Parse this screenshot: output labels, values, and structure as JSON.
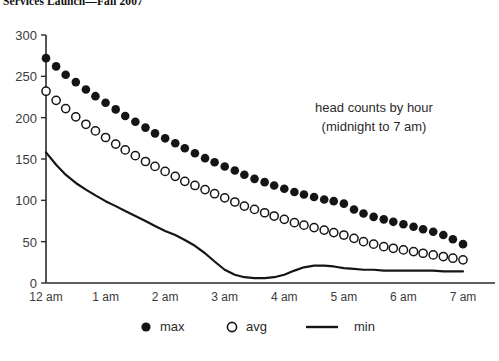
{
  "title": "Services Launch—Fall 2007",
  "annotation": {
    "line1": "head counts by hour",
    "line2": "(midnight to 7 am)"
  },
  "legend": {
    "position": "bottom",
    "items": [
      {
        "label": "max",
        "marker": "filled-circle",
        "color": "#151515"
      },
      {
        "label": "avg",
        "marker": "open-circle",
        "color": "#151515"
      },
      {
        "label": "min",
        "marker": "line",
        "color": "#151515"
      }
    ]
  },
  "chart_data": {
    "type": "scatter",
    "title": "Services Launch—Fall 2007",
    "xlabel": "",
    "ylabel": "",
    "grid": false,
    "ylim": [
      0,
      300
    ],
    "xlim": [
      0,
      7
    ],
    "yticks": [
      0,
      50,
      100,
      150,
      200,
      250,
      300
    ],
    "ytick_labels": [
      "0",
      "50",
      "100",
      "150",
      "200",
      "250",
      "300"
    ],
    "xticks": [
      0,
      1,
      2,
      3,
      4,
      5,
      6,
      7
    ],
    "xtick_labels": [
      "12 am",
      "1 am",
      "2 am",
      "3 am",
      "4 am",
      "5 am",
      "6 am",
      "7 am"
    ],
    "x": [
      0,
      0.17,
      0.33,
      0.5,
      0.67,
      0.83,
      1,
      1.17,
      1.33,
      1.5,
      1.67,
      1.83,
      2,
      2.17,
      2.33,
      2.5,
      2.67,
      2.83,
      3,
      3.17,
      3.33,
      3.5,
      3.67,
      3.83,
      4,
      4.17,
      4.33,
      4.5,
      4.67,
      4.83,
      5,
      5.17,
      5.33,
      5.5,
      5.67,
      5.83,
      6,
      6.17,
      6.33,
      6.5,
      6.67,
      6.83,
      7
    ],
    "series": [
      {
        "name": "max",
        "marker": "filled-circle",
        "color": "#151515",
        "values": [
          272,
          262,
          252,
          243,
          234,
          226,
          218,
          210,
          202,
          195,
          188,
          181,
          175,
          169,
          163,
          157,
          151,
          146,
          141,
          136,
          131,
          126,
          122,
          118,
          114,
          110,
          107,
          104,
          101,
          99,
          96,
          89,
          84,
          80,
          77,
          74,
          71,
          68,
          65,
          62,
          58,
          53,
          47
        ]
      },
      {
        "name": "avg",
        "marker": "open-circle",
        "color": "#151515",
        "values": [
          232,
          221,
          211,
          201,
          192,
          184,
          176,
          168,
          161,
          154,
          147,
          141,
          135,
          129,
          123,
          118,
          113,
          108,
          103,
          98,
          93,
          89,
          85,
          81,
          77,
          73,
          70,
          67,
          64,
          61,
          58,
          54,
          50,
          47,
          44,
          42,
          40,
          38,
          36,
          34,
          32,
          30,
          28
        ]
      },
      {
        "name": "min",
        "marker": "line",
        "color": "#151515",
        "values": [
          158,
          143,
          131,
          121,
          113,
          106,
          99,
          93,
          87,
          81,
          75,
          69,
          63,
          58,
          52,
          45,
          36,
          26,
          16,
          10,
          7,
          6,
          6,
          7,
          10,
          15,
          19,
          21,
          21,
          20,
          18,
          17,
          16,
          16,
          15,
          15,
          15,
          15,
          15,
          15,
          14,
          14,
          14
        ]
      }
    ]
  }
}
